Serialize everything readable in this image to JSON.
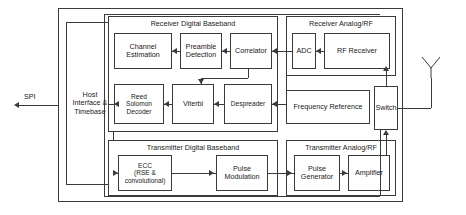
{
  "diagram": {
    "chip_boundary_label": "",
    "external": {
      "spi_label": "SPI",
      "antenna_label": "antenna"
    },
    "groups": [
      {
        "id": "rx_digital",
        "label": "Receiver Digital Baseband"
      },
      {
        "id": "rx_analog",
        "label": "Receiver Analog/RF"
      },
      {
        "id": "tx_digital",
        "label": "Transmitter Digital Baseband"
      },
      {
        "id": "tx_analog",
        "label": "Transmitter Analog/RF"
      }
    ],
    "blocks": {
      "host": {
        "line1": "Host",
        "line2": "Interface &",
        "line3": "Timebase"
      },
      "channel_est": {
        "line1": "Channel",
        "line2": "Estimation"
      },
      "preamble": {
        "line1": "Preamble",
        "line2": "Detection"
      },
      "correlator": {
        "line1": "Correlator"
      },
      "adc": {
        "line1": "ADC"
      },
      "rf_receiver": {
        "line1": "RF Receiver"
      },
      "reed": {
        "line1": "Reed",
        "line2": "Solomon",
        "line3": "Decoder"
      },
      "viterbi": {
        "line1": "Viterbi"
      },
      "despreader": {
        "line1": "Despreader"
      },
      "freq_ref": {
        "line1": "Frequency Reference"
      },
      "switch": {
        "line1": "Switch"
      },
      "ecc": {
        "line1": "ECC",
        "line2": "(RSE &",
        "line3": "convolutional)"
      },
      "pulse_mod": {
        "line1": "Pulse",
        "line2": "Modulation"
      },
      "pulse_gen": {
        "line1": "Pulse",
        "line2": "Generator"
      },
      "amplifier": {
        "line1": "Amplifier"
      }
    },
    "colors": {
      "line": "#3a3a3a",
      "text": "#1a1a1a",
      "background": "#ffffff"
    }
  }
}
